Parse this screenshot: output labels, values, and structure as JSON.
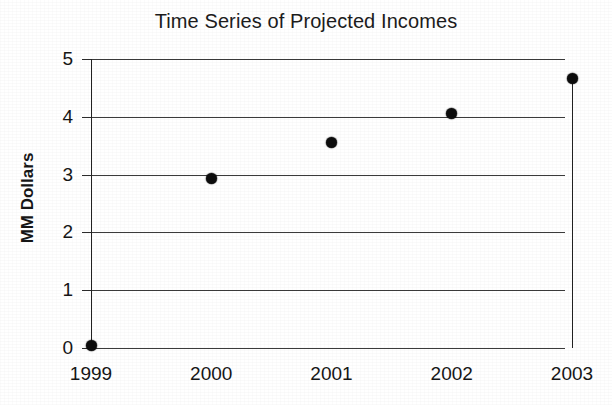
{
  "chart_data": {
    "type": "scatter",
    "title": "Time Series of Projected Incomes",
    "xlabel": "",
    "ylabel": "MM Dollars",
    "x_categories": [
      "1999",
      "2000",
      "2001",
      "2002",
      "2003"
    ],
    "x_tick_labels": [
      "1999",
      "2000",
      "2001",
      "2002",
      "2003"
    ],
    "y_tick_labels": [
      "0",
      "1",
      "2",
      "3",
      "4",
      "5"
    ],
    "y_ticks": [
      0,
      1,
      2,
      3,
      4,
      5
    ],
    "ylim": [
      0,
      5
    ],
    "xlim": [
      "1999",
      "2003"
    ],
    "grid": "horizontal",
    "legend": "none",
    "marker": "filled-circle",
    "marker_color": "#0d0d0d",
    "series": [
      {
        "name": "Projected Income",
        "x": [
          "1999",
          "2000",
          "2001",
          "2002",
          "2003"
        ],
        "values": [
          0.05,
          2.94,
          3.55,
          4.05,
          4.67
        ]
      }
    ],
    "annotations": [
      {
        "kind": "vertical-line",
        "at_x": "2003",
        "from_y": 0,
        "to_y": 4.67,
        "color": "#232323"
      }
    ]
  },
  "figure": {
    "background_color": "#ffffff",
    "axis_color": "#222222",
    "gridline_color": "#2a2a2a"
  }
}
